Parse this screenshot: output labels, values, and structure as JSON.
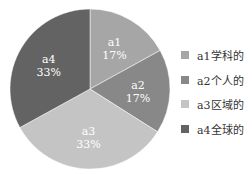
{
  "chart_data": {
    "type": "pie",
    "title": "",
    "categories": [
      "a1学科的",
      "a2个人的",
      "a3区域的",
      "a4全球的"
    ],
    "values": [
      17,
      17,
      33,
      33
    ],
    "slice_labels": [
      {
        "name": "a1",
        "pct": "17%"
      },
      {
        "name": "a2",
        "pct": "17%"
      },
      {
        "name": "a3",
        "pct": "33%"
      },
      {
        "name": "a4",
        "pct": "33%"
      }
    ],
    "colors": [
      "#a6a6a6",
      "#888888",
      "#c4c4c4",
      "#636363"
    ],
    "legend_position": "right",
    "start_angle": "12 o'clock, clockwise"
  },
  "legend": {
    "items": [
      {
        "label": "a1学科的",
        "color": "#a6a6a6"
      },
      {
        "label": "a2个人的",
        "color": "#888888"
      },
      {
        "label": "a3区域的",
        "color": "#c4c4c4"
      },
      {
        "label": "a4全球的",
        "color": "#636363"
      }
    ]
  }
}
